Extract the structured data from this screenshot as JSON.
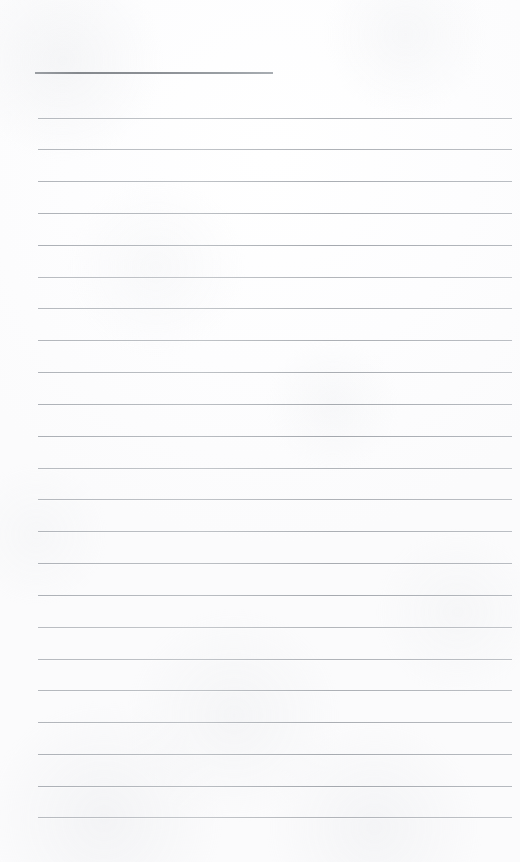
{
  "document": {
    "kind": "scanned-lined-page",
    "description": "Blank ruled notebook page scan",
    "page_width": 520,
    "page_height": 862,
    "paper_color": "#fdfdfd",
    "rule_color": "#b4b8bd",
    "header_rule_color": "#8c9095",
    "text_content": "",
    "visible_text": []
  },
  "header_rule": {
    "x": 35,
    "y": 72,
    "width": 238,
    "height": 2
  },
  "ruling": {
    "left": 38,
    "right": 512,
    "width": 474,
    "spacing": 31.8,
    "count": 23,
    "first_y": 118,
    "last_y": 817,
    "lines": [
      {
        "index": 1,
        "y": 118
      },
      {
        "index": 2,
        "y": 149
      },
      {
        "index": 3,
        "y": 181
      },
      {
        "index": 4,
        "y": 213
      },
      {
        "index": 5,
        "y": 245
      },
      {
        "index": 6,
        "y": 277
      },
      {
        "index": 7,
        "y": 308
      },
      {
        "index": 8,
        "y": 340
      },
      {
        "index": 9,
        "y": 372
      },
      {
        "index": 10,
        "y": 404
      },
      {
        "index": 11,
        "y": 436
      },
      {
        "index": 12,
        "y": 468
      },
      {
        "index": 13,
        "y": 499
      },
      {
        "index": 14,
        "y": 531
      },
      {
        "index": 15,
        "y": 563
      },
      {
        "index": 16,
        "y": 595
      },
      {
        "index": 17,
        "y": 627
      },
      {
        "index": 18,
        "y": 659
      },
      {
        "index": 19,
        "y": 690
      },
      {
        "index": 20,
        "y": 722
      },
      {
        "index": 21,
        "y": 754
      },
      {
        "index": 22,
        "y": 786
      },
      {
        "index": 23,
        "y": 817
      }
    ]
  }
}
